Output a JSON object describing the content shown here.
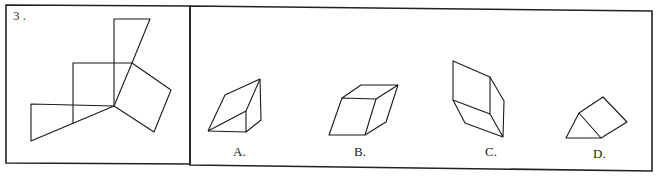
{
  "question": {
    "number": "3",
    "number_label": "3 .",
    "description": "Unfolded net (left) and four candidate solids (right)"
  },
  "options": [
    {
      "key": "A",
      "label": "A.",
      "shape": "triangular-prism"
    },
    {
      "key": "B",
      "label": "B.",
      "shape": "slanted-prism-parallelepiped"
    },
    {
      "key": "C",
      "label": "C.",
      "shape": "tall-slanted-prism"
    },
    {
      "key": "D",
      "label": "D.",
      "shape": "small-triangular-prism"
    }
  ],
  "colors": {
    "line": "#1a1a1a",
    "background": "#ffffff"
  }
}
